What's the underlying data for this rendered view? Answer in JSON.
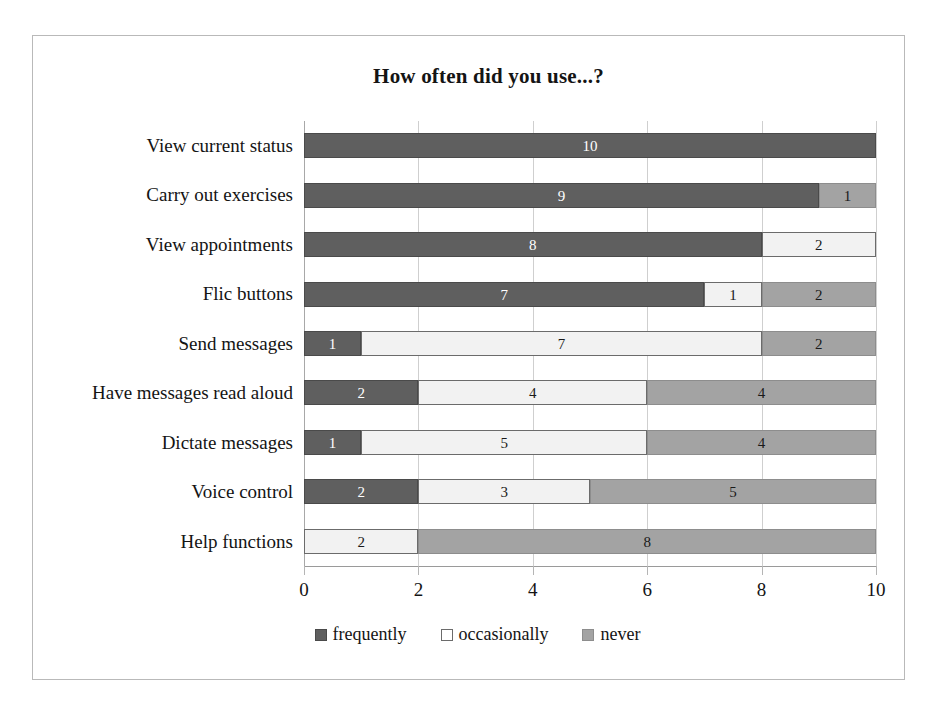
{
  "chart_data": {
    "type": "bar",
    "orientation": "horizontal",
    "stacked": true,
    "title": "How often did you use...?",
    "xlabel": "",
    "ylabel": "",
    "xlim": [
      0,
      10
    ],
    "xticks": [
      0,
      2,
      4,
      6,
      8,
      10
    ],
    "grid": true,
    "legend_position": "bottom",
    "categories": [
      "View current status",
      "Carry out exercises",
      "View appointments",
      "Flic buttons",
      "Send messages",
      "Have messages read aloud",
      "Dictate messages",
      "Voice control",
      "Help functions"
    ],
    "series": [
      {
        "name": "frequently",
        "color": "#5f5f5f",
        "values": [
          10,
          9,
          8,
          7,
          1,
          2,
          1,
          2,
          0
        ]
      },
      {
        "name": "occasionally",
        "color": "#ffffff",
        "values": [
          0,
          0,
          2,
          1,
          7,
          4,
          5,
          3,
          2
        ]
      },
      {
        "name": "never",
        "color": "#a3a3a3",
        "values": [
          0,
          1,
          0,
          2,
          2,
          4,
          4,
          5,
          8
        ]
      }
    ],
    "bar_labels": [
      [
        "10",
        "",
        ""
      ],
      [
        "9",
        "",
        "1"
      ],
      [
        "8",
        "2",
        ""
      ],
      [
        "7",
        "1",
        "2"
      ],
      [
        "1",
        "7",
        "2"
      ],
      [
        "2",
        "4",
        "4"
      ],
      [
        "1",
        "5",
        "4"
      ],
      [
        "2",
        "3",
        "5"
      ],
      [
        "",
        "2",
        "8"
      ]
    ]
  },
  "legend": {
    "items": [
      {
        "label": "frequently",
        "swatch": "frequently"
      },
      {
        "label": "occasionally",
        "swatch": "occasionally"
      },
      {
        "label": "never",
        "swatch": "never"
      }
    ]
  }
}
